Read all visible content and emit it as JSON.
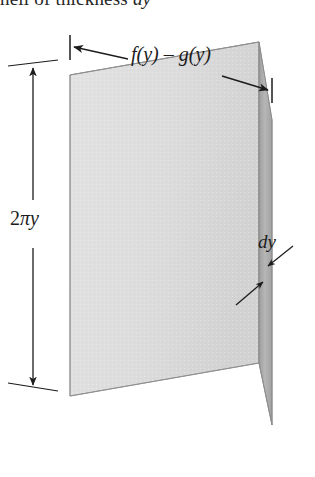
{
  "figure": {
    "name": "cylindrical-shell-diagram",
    "caption_fragment": "hell of thickness dy",
    "caption_roman": "hell of thickness",
    "caption_italic": "dy",
    "background_color": "#ffffff",
    "ink_color": "#1c1c1c"
  },
  "labels": {
    "width_label": "f(y) – g(y)",
    "height_label": "2πy",
    "height_label_number": "2",
    "height_label_pi": "π",
    "height_label_var": "y",
    "thickness_label": "dy"
  },
  "solid": {
    "name": "rectangular-slab",
    "front_face_color": "#dedede",
    "top_face_color": "#b9b9b9",
    "side_face_color": "#b0b0b0",
    "edge_color": "#9a9a9a",
    "front_face": {
      "left_x": 70,
      "right_x": 259,
      "top_y": 75,
      "bottom_y": 396
    },
    "depth_offset": {
      "dx": 13,
      "dy": -33
    }
  },
  "dimensions": {
    "width_dimension": {
      "name": "width-dimension",
      "start": {
        "x": 70,
        "y": 47
      },
      "end": {
        "x": 272,
        "y": 89
      },
      "tick_length": 22,
      "arrow_style": "outward-double"
    },
    "height_dimension": {
      "name": "height-dimension",
      "x": 33,
      "top_y": 64,
      "bottom_y": 389,
      "tick_half_width": 28,
      "arrow_style": "outward-double"
    },
    "thickness_leaders": {
      "name": "thickness-leader-arrows",
      "upper": {
        "from": {
          "x": 292,
          "y": 245
        },
        "to": {
          "x": 270,
          "y": 265
        }
      },
      "lower": {
        "from": {
          "x": 238,
          "y": 303
        },
        "to": {
          "x": 262,
          "y": 281
        }
      }
    }
  },
  "colors": {
    "paper": "#ffffff",
    "line": "#1c1c1c",
    "light_gray": "#dedede",
    "mid_gray": "#b9b9b9",
    "dark_gray": "#a8a8a8"
  }
}
